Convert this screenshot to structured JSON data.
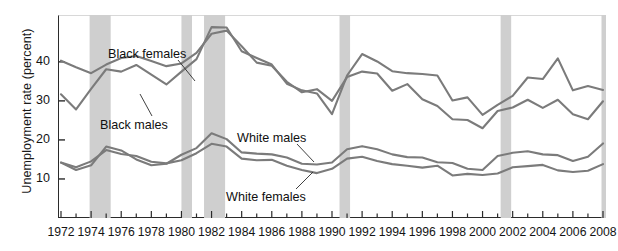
{
  "chart_data": {
    "type": "line",
    "title": "",
    "xlabel": "",
    "ylabel": "Unemployment rate (percent)",
    "xlim": [
      1972,
      2008
    ],
    "ylim": [
      0,
      52
    ],
    "yticks": [
      10,
      20,
      30,
      40
    ],
    "ytick_labels": [
      "10",
      "20",
      "30",
      "40"
    ],
    "xticks": [
      1972,
      1974,
      1976,
      1978,
      1980,
      1982,
      1984,
      1986,
      1988,
      1990,
      1992,
      1994,
      1996,
      1998,
      2000,
      2002,
      2004,
      2006,
      2008
    ],
    "xtick_labels": [
      "1972",
      "1974",
      "1976",
      "1978",
      "1980",
      "1982",
      "1984",
      "1986",
      "1988",
      "1990",
      "1992",
      "1994",
      "1996",
      "1998",
      "2000",
      "2002",
      "2004",
      "2006",
      "2008"
    ],
    "x": [
      1972,
      1973,
      1974,
      1975,
      1976,
      1977,
      1978,
      1979,
      1980,
      1981,
      1982,
      1983,
      1984,
      1985,
      1986,
      1987,
      1988,
      1989,
      1990,
      1991,
      1992,
      1993,
      1994,
      1995,
      1996,
      1997,
      1998,
      1999,
      2000,
      2001,
      2002,
      2003,
      2004,
      2005,
      2006,
      2007,
      2008
    ],
    "grid": false,
    "legend_position": "inline-annotations",
    "line_color": "#7b7b7b",
    "recession_band_color": "#cfcfcf",
    "series": [
      {
        "name": "Black females",
        "label": "Black females",
        "values": [
          40.3,
          38.6,
          37.1,
          39.3,
          41.0,
          41.5,
          40.2,
          38.9,
          39.6,
          42.3,
          47.2,
          48.0,
          44.0,
          39.8,
          39.0,
          34.9,
          32.2,
          33.0,
          30.0,
          36.1,
          37.5,
          37.0,
          32.6,
          34.3,
          30.4,
          28.7,
          25.3,
          25.1,
          23.0,
          27.4,
          28.3,
          30.3,
          28.2,
          30.3,
          26.6,
          25.3,
          29.9
        ]
      },
      {
        "name": "Black males",
        "label": "Black males",
        "values": [
          31.7,
          27.8,
          33.1,
          38.1,
          37.5,
          39.2,
          36.7,
          34.2,
          37.5,
          40.7,
          48.9,
          48.8,
          42.7,
          41.0,
          39.3,
          34.4,
          32.7,
          31.9,
          26.6,
          36.5,
          42.0,
          40.1,
          37.6,
          37.1,
          36.9,
          36.5,
          30.1,
          30.9,
          26.4,
          29.0,
          31.3,
          36.0,
          35.6,
          40.9,
          32.7,
          33.8,
          32.8
        ]
      },
      {
        "name": "White males",
        "label": "White males",
        "values": [
          14.2,
          12.3,
          13.5,
          18.3,
          17.3,
          15.0,
          13.5,
          13.9,
          16.2,
          17.9,
          21.7,
          20.2,
          16.8,
          16.5,
          16.3,
          15.5,
          13.9,
          13.7,
          14.2,
          17.6,
          18.4,
          17.6,
          16.3,
          15.6,
          15.5,
          14.3,
          14.1,
          12.6,
          12.3,
          15.9,
          16.7,
          17.1,
          16.3,
          16.1,
          14.6,
          15.7,
          19.1
        ]
      },
      {
        "name": "White females",
        "label": "White females",
        "values": [
          14.2,
          13.0,
          14.5,
          17.4,
          16.4,
          15.9,
          14.4,
          14.0,
          14.8,
          16.6,
          19.0,
          18.3,
          15.2,
          14.8,
          14.9,
          13.4,
          12.3,
          11.5,
          12.6,
          15.2,
          15.7,
          14.6,
          13.8,
          13.4,
          12.9,
          13.4,
          10.9,
          11.3,
          11.0,
          11.4,
          13.0,
          13.3,
          13.6,
          12.2,
          11.8,
          12.1,
          13.8
        ]
      }
    ],
    "recession_bands": [
      {
        "start": 1973.9,
        "end": 1975.3
      },
      {
        "start": 1980.0,
        "end": 1980.7
      },
      {
        "start": 1981.5,
        "end": 1982.9
      },
      {
        "start": 1990.5,
        "end": 1991.2
      },
      {
        "start": 2001.2,
        "end": 2001.9
      },
      {
        "start": 2007.9,
        "end": 2008.7
      }
    ],
    "annotations": [
      {
        "name": "black-females-label",
        "text": "Black females",
        "x_px": 108,
        "y_px": 47,
        "leader": [
          [
            178,
            60
          ],
          [
            195,
            81
          ]
        ]
      },
      {
        "name": "black-males-label",
        "text": "Black males",
        "x_px": 100,
        "y_px": 118,
        "leader": [
          [
            152,
            116
          ],
          [
            140,
            94
          ]
        ]
      },
      {
        "name": "white-males-label",
        "text": "White males",
        "x_px": 237,
        "y_px": 131,
        "leader": [
          [
            297,
            144
          ],
          [
            314,
            162
          ]
        ]
      },
      {
        "name": "white-females-label",
        "text": "White females",
        "x_px": 226,
        "y_px": 190,
        "leader": [
          [
            296,
            189
          ],
          [
            313,
            172
          ]
        ]
      }
    ]
  }
}
